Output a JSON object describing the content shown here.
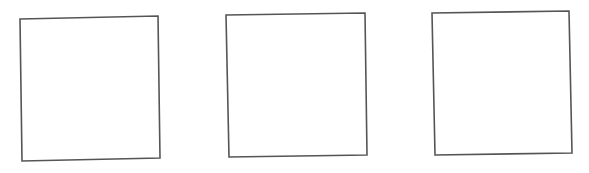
{
  "canvas": {
    "width": 589,
    "height": 173,
    "background": "#ffffff"
  },
  "style": {
    "stroke": "#555555",
    "stroke_width": 1.6,
    "fill": "#ffffff"
  },
  "boxes": [
    {
      "id": "box-1",
      "points": [
        [
          20,
          19
        ],
        [
          158,
          16
        ],
        [
          160,
          158
        ],
        [
          22,
          161
        ]
      ]
    },
    {
      "id": "box-2",
      "points": [
        [
          226,
          15
        ],
        [
          365,
          13
        ],
        [
          367,
          155
        ],
        [
          229,
          157
        ]
      ]
    },
    {
      "id": "box-3",
      "points": [
        [
          432,
          13
        ],
        [
          569,
          11
        ],
        [
          572,
          153
        ],
        [
          435,
          155
        ]
      ]
    }
  ]
}
